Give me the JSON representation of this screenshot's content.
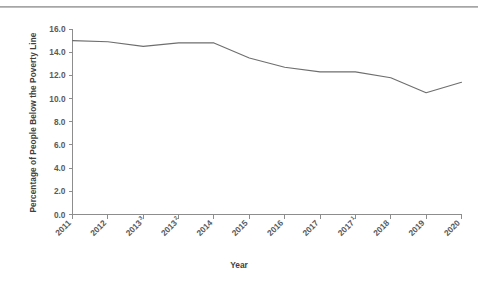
{
  "figure": {
    "has_top_rule": true,
    "background_color": "#ffffff",
    "line_color": "#6e6e6e",
    "axis_color": "#8d8d8d",
    "text_color": "#5a5a5a"
  },
  "chart_data": {
    "type": "line",
    "title": "",
    "subtitle": "",
    "xlabel": "Year",
    "ylabel": "Percentage of People Below the Poverty Line",
    "categories": [
      "2011",
      "2012",
      "2013³",
      "2013²",
      "2014",
      "2015",
      "2016",
      "2017",
      "2017¹",
      "2018",
      "2019",
      "2020"
    ],
    "category_bases": [
      "2011",
      "2012",
      "2013",
      "2013",
      "2014",
      "2015",
      "2016",
      "2017",
      "2017",
      "2018",
      "2019",
      "2020"
    ],
    "category_superscripts": [
      "",
      "",
      "3",
      "2",
      "",
      "",
      "",
      "",
      "1",
      "",
      "",
      ""
    ],
    "values": [
      15.0,
      14.9,
      14.5,
      14.8,
      14.8,
      13.5,
      12.7,
      12.3,
      12.3,
      11.8,
      10.5,
      11.4
    ],
    "series": [
      {
        "name": "Percentage of People Below the Poverty Line",
        "values": [
          15.0,
          14.9,
          14.5,
          14.8,
          14.8,
          13.5,
          12.7,
          12.3,
          12.3,
          11.8,
          10.5,
          11.4
        ]
      }
    ],
    "ylim": [
      0.0,
      16.0
    ],
    "ytick_labels": [
      "0.0",
      "2.0",
      "4.0",
      "6.0",
      "8.0",
      "10.0",
      "12.0",
      "14.0",
      "16.0"
    ],
    "ytick_values": [
      0.0,
      2.0,
      4.0,
      6.0,
      8.0,
      10.0,
      12.0,
      14.0,
      16.0
    ],
    "grid": false,
    "legend": "none",
    "xtick_rotation": -45
  }
}
